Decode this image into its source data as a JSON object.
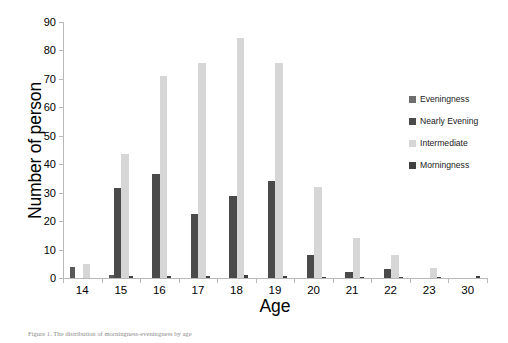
{
  "chart_data": {
    "type": "bar",
    "title": "",
    "xlabel": "Age",
    "ylabel": "Number of person",
    "ylim": [
      0,
      90
    ],
    "yticks": [
      0,
      10,
      20,
      30,
      40,
      50,
      60,
      70,
      80,
      90
    ],
    "grid": false,
    "legend_position": "right",
    "categories": [
      "14",
      "15",
      "16",
      "17",
      "18",
      "19",
      "20",
      "21",
      "22",
      "23",
      "30"
    ],
    "series": [
      {
        "name": "Eveningness",
        "color": "#595959",
        "values": [
          4,
          1,
          0,
          0,
          0,
          0,
          0,
          0,
          0,
          0,
          0
        ]
      },
      {
        "name": "Nearly Evening",
        "color": "#4a4a4a",
        "values": [
          0,
          31.5,
          36.5,
          22.5,
          29,
          34,
          8,
          2,
          3,
          0,
          0
        ]
      },
      {
        "name": "Intermediate",
        "color": "#d6d6d6",
        "values": [
          5,
          43.5,
          71,
          75.5,
          84.5,
          75.5,
          32,
          14,
          8,
          3.5,
          0
        ]
      },
      {
        "name": "Morningness",
        "color": "#3f3f3f",
        "values": [
          0,
          0.8,
          0.6,
          0.6,
          1,
          0.6,
          0.5,
          0.4,
          0.4,
          0.5,
          0.6
        ]
      }
    ]
  },
  "legend": {
    "items": [
      {
        "label": "Eveningness",
        "color": "#6e6e6e"
      },
      {
        "label": "Nearly Evening",
        "color": "#4a4a4a"
      },
      {
        "label": "Intermediate",
        "color": "#d6d6d6"
      },
      {
        "label": "Morningness",
        "color": "#3f3f3f"
      }
    ]
  },
  "axis": {
    "x_title": "Age",
    "y_title": "Number of person"
  },
  "caption": {
    "text": "Figure 1. The distribution of morningness-eveningness by age"
  },
  "colors": {
    "axis_line": "#b9b9b9",
    "text": "#000000",
    "background": "#ffffff"
  }
}
